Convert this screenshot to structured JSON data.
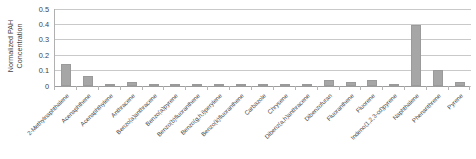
{
  "chart_data": {
    "type": "bar",
    "title": "",
    "xlabel": "",
    "ylabel": "Normalized PAH Concentration",
    "ylabel_lines": [
      "Normalized PAH",
      "Concentration"
    ],
    "ylim": [
      0,
      0.5
    ],
    "ytick_labels": [
      "0",
      "0.1",
      "0.2",
      "0.3",
      "0.4",
      "0.5"
    ],
    "ytick_values": [
      0,
      0.1,
      0.2,
      0.3,
      0.4,
      0.5
    ],
    "grid": true,
    "legend": "none",
    "bar_color": "#a6a6a6",
    "categories": [
      "2-Methylnaphthalene",
      "Acenaphthene",
      "Acenaphthylene",
      "Anthracene",
      "Benzo(a)anthracene",
      "Benzo(a)pyrene",
      "Benzo(b)fluoranthene",
      "Benzo(g,h,i)perylene",
      "Benzo(k)fluoranthene",
      "Carbazole",
      "Chrysene",
      "Dibenz(a,h)anthracene",
      "Dibenzofuran",
      "Fluoranthene",
      "Fluorene",
      "Indeno(1,2,3-cd)pyrene",
      "Naphthalene",
      "Phenanthrene",
      "Pyrene"
    ],
    "values": [
      0.14,
      0.06,
      0.0,
      0.025,
      0.0,
      0.0,
      0.0,
      0.0,
      0.0,
      0.0,
      0.0,
      0.0,
      0.035,
      0.02,
      0.035,
      0.0,
      0.39,
      0.1,
      0.02
    ]
  }
}
